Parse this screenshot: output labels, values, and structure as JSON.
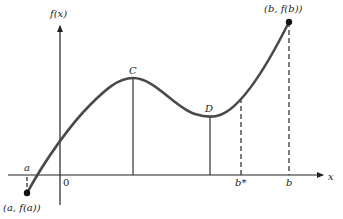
{
  "diagram": {
    "y_axis_label": "f(x)",
    "x_axis_label": "x",
    "origin_label": "0",
    "point_C_label": "C",
    "point_D_label": "D",
    "a_label": "a",
    "b_star_label": "b*",
    "b_label": "b",
    "start_point_label": "(a, f(a))",
    "end_point_label": "(b, f(b))",
    "colors": {
      "curve": "#4a4a4a",
      "axes": "#222222",
      "points": "#111111"
    }
  }
}
